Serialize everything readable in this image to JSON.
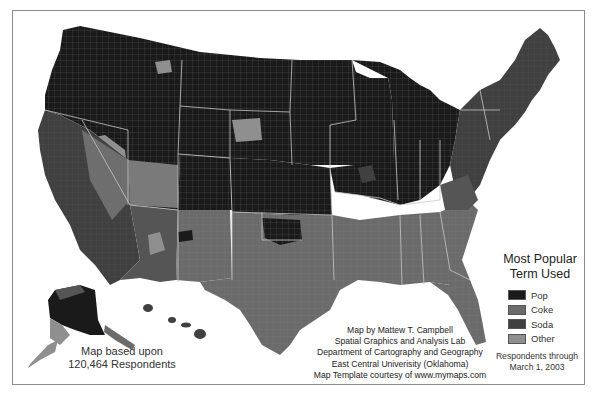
{
  "map": {
    "subject": "Pop vs Soda vs Coke — most popular generic term for soft drinks by US county",
    "regions_by_term": {
      "Pop": [
        "Pacific Northwest",
        "Northern Rockies",
        "Great Plains (north)",
        "Upper Midwest",
        "Great Lakes",
        "Ohio / western Pennsylvania",
        "Alaska (interior)"
      ],
      "Soda": [
        "New England",
        "Mid-Atlantic / New York",
        "California (northern)",
        "Nevada / Arizona",
        "St. Louis area",
        "Wisconsin (east)"
      ],
      "Coke": [
        "Southeast",
        "Texas",
        "Oklahoma (south)",
        "Louisiana",
        "Georgia",
        "Alabama",
        "Mississippi",
        "Tennessee"
      ],
      "Other": [
        "Scattered counties in Mountain West",
        "Southern California pockets",
        "New Mexico / Utah pockets"
      ]
    }
  },
  "legend": {
    "title_line1": "Most Popular",
    "title_line2": "Term Used",
    "items": [
      {
        "label": "Pop",
        "color": "#1a1a1a"
      },
      {
        "label": "Coke",
        "color": "#6b6b6b"
      },
      {
        "label": "Soda",
        "color": "#404040"
      },
      {
        "label": "Other",
        "color": "#8f8f8f"
      }
    ]
  },
  "credits": {
    "line1": "Map by Mattew T. Campbell",
    "line2": "Spatial Graphics and Analysis Lab",
    "line3": "Department of Cartography and Geography",
    "line4": "East Central Univerisity (Oklahoma)",
    "line5": "Map Template courtesy of www.mymaps.com"
  },
  "respondents": {
    "line1": "Map based upon",
    "line2": "120,464 Respondents"
  },
  "through": {
    "line1": "Respondents through",
    "line2": "March 1, 2003"
  },
  "colors": {
    "pop": "#1a1a1a",
    "soda": "#404040",
    "coke": "#6b6b6b",
    "other": "#8f8f8f",
    "border": "#c8c8c8",
    "frame": "#8c8c8c"
  }
}
